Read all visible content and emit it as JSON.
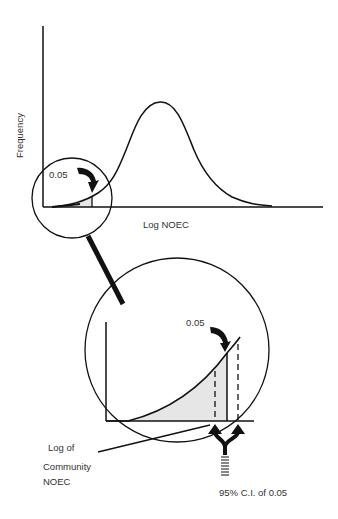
{
  "top_plot": {
    "y_axis_label": "Frequency",
    "x_axis_label": "Log NOEC",
    "tail_label": "0.05"
  },
  "inset_plot": {
    "tail_label": "0.05",
    "community_label_line1": "Log of",
    "community_label_line2": "Community",
    "community_label_line3": "NOEC",
    "ci_label": "95% C.I. of 0.05"
  },
  "colors": {
    "line": "#111111",
    "shade": "#e6e6e6",
    "background": "#ffffff"
  }
}
